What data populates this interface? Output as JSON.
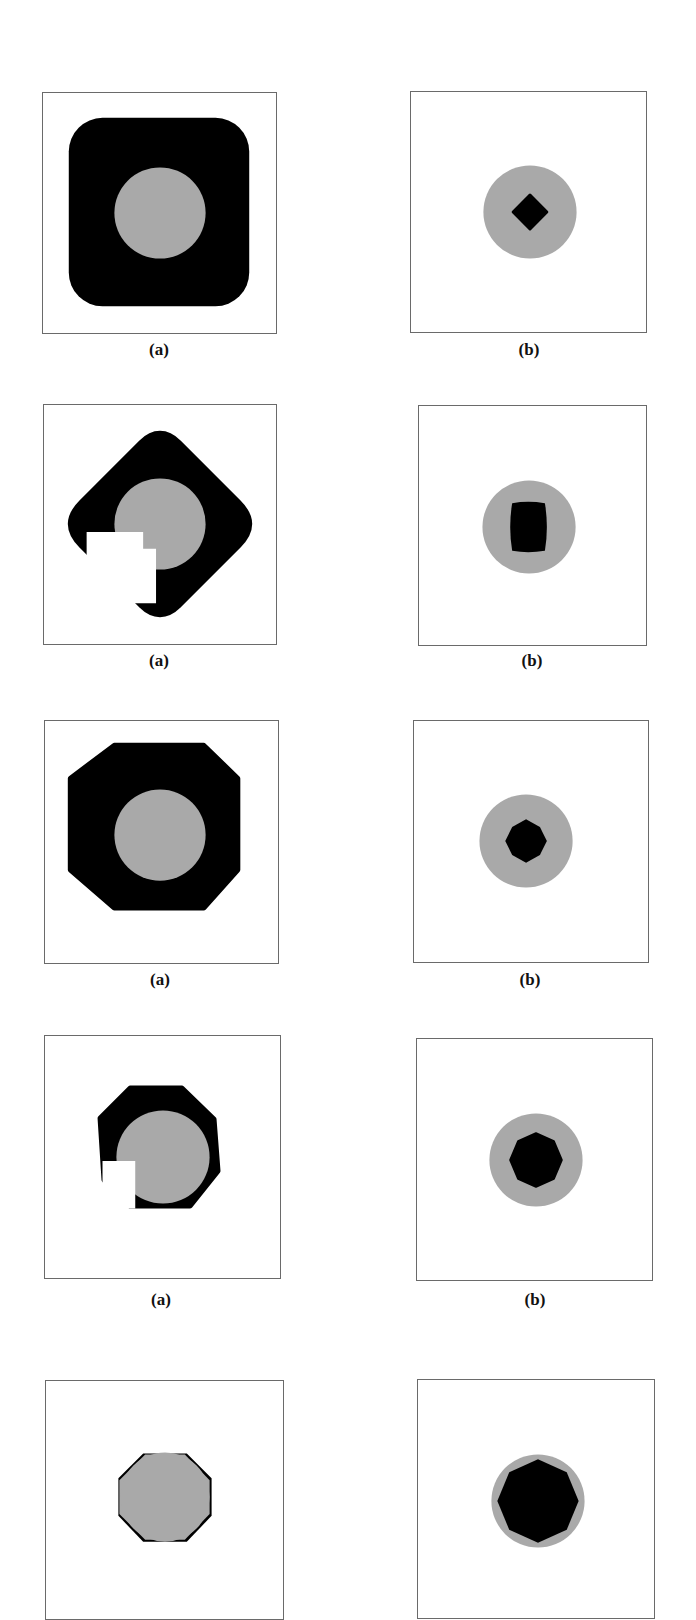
{
  "figure": {
    "colors": {
      "background": "#ffffff",
      "frame": "#6a6a6a",
      "black": "#000000",
      "gray": "#a9a9a9"
    },
    "rows": [
      {
        "left": {
          "caption": "(a)",
          "description": "black rounded square with gray circle"
        },
        "right": {
          "caption": "(b)",
          "description": "gray circle with small black diamond"
        }
      },
      {
        "left": {
          "caption": "(a)",
          "description": "black rounded diamond with gray circle and white occluding block"
        },
        "right": {
          "caption": "(b)",
          "description": "gray circle with black rounded square"
        }
      },
      {
        "left": {
          "caption": "(a)",
          "description": "black octagon with gray circle"
        },
        "right": {
          "caption": "(b)",
          "description": "gray circle with small black octagon"
        }
      },
      {
        "left": {
          "caption": "(a)",
          "description": "black octagonal ring with gray circle and white occluding block"
        },
        "right": {
          "caption": "(b)",
          "description": "gray circle with black octagon"
        }
      },
      {
        "left": {
          "caption": "",
          "description": "gray octagonal disk with thin black corners"
        },
        "right": {
          "caption": "",
          "description": "gray circle with large black octagon"
        }
      }
    ]
  }
}
